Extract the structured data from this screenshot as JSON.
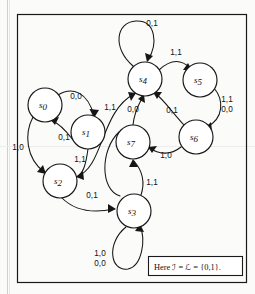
{
  "figure": {
    "type": "state-transition-diagram",
    "caption": "Here ℐ = ℒ = {0,1}.",
    "caption_parts": {
      "prefix": "Here",
      "input_alphabet_symbol": "ℐ",
      "output_alphabet_symbol": "ℒ",
      "alphabet_value": "{0,1}",
      "terminator": "."
    },
    "border_color": "#1a1a1a",
    "ink_color": "#161616",
    "background_color": "#ffffff"
  },
  "states": [
    {
      "id": "s0",
      "label": "s",
      "subscript": "0",
      "cx": 45,
      "cy": 105,
      "r": 17
    },
    {
      "id": "s1",
      "label": "s",
      "subscript": "1",
      "cx": 88,
      "cy": 132,
      "r": 17
    },
    {
      "id": "s2",
      "label": "s",
      "subscript": "2",
      "cx": 60,
      "cy": 181,
      "r": 17
    },
    {
      "id": "s3",
      "label": "s",
      "subscript": "3",
      "cx": 134,
      "cy": 211,
      "r": 17
    },
    {
      "id": "s4",
      "label": "s",
      "subscript": "4",
      "cx": 145,
      "cy": 79,
      "r": 17
    },
    {
      "id": "s5",
      "label": "s",
      "subscript": "5",
      "cx": 200,
      "cy": 80,
      "r": 17
    },
    {
      "id": "s6",
      "label": "s",
      "subscript": "6",
      "cx": 196,
      "cy": 137,
      "r": 17
    },
    {
      "id": "s7",
      "label": "s",
      "subscript": "7",
      "cx": 133,
      "cy": 142,
      "r": 17
    }
  ],
  "transitions": [
    {
      "id": "t-s0-s1",
      "from": "s0",
      "to": "s1",
      "label": "0,0",
      "label_x": 76,
      "label_y": 99
    },
    {
      "id": "t-s1-s0",
      "from": "s1",
      "to": "s0",
      "label": "0,1",
      "label_x": 64,
      "label_y": 140
    },
    {
      "id": "t-s0-s2",
      "from": "s0",
      "to": "s2",
      "label": "1,0",
      "label_x": 18,
      "label_y": 150
    },
    {
      "id": "t-s1-s2",
      "from": "s1",
      "to": "s2",
      "label": "1,1",
      "label_x": 80,
      "label_y": 162
    },
    {
      "id": "t-s2-s3",
      "from": "s2",
      "to": "s3",
      "label": "0,1",
      "label_x": 92,
      "label_y": 198
    },
    {
      "id": "t-s2-s4",
      "from": "s2",
      "to": "s4",
      "label": "1,1",
      "label_x": 110,
      "label_y": 110
    },
    {
      "id": "t-s3-s3",
      "from": "s3",
      "to": "s3",
      "label": "1,0\n0,0",
      "label_x": 100,
      "label_y": 258
    },
    {
      "id": "t-s3-s7",
      "from": "s3",
      "to": "s7",
      "label": "1,1",
      "label_x": 152,
      "label_y": 185
    },
    {
      "id": "t-s4-s4",
      "from": "s4",
      "to": "s4",
      "label": "0,1",
      "label_x": 152,
      "label_y": 26
    },
    {
      "id": "t-s4-s5",
      "from": "s4",
      "to": "s5",
      "label": "1,1",
      "label_x": 176,
      "label_y": 55
    },
    {
      "id": "t-s5-s6",
      "from": "s5",
      "to": "s6",
      "label": "1,1\n0,0",
      "label_x": 227,
      "label_y": 104
    },
    {
      "id": "t-s6-s4",
      "from": "s6",
      "to": "s4",
      "label": "0,1",
      "label_x": 172,
      "label_y": 113
    },
    {
      "id": "t-s6-s7",
      "from": "s6",
      "to": "s7",
      "label": "1,0",
      "label_x": 166,
      "label_y": 158
    },
    {
      "id": "t-s7-s4",
      "from": "s7",
      "to": "s4",
      "label": "0,0",
      "label_x": 133,
      "label_y": 112
    }
  ],
  "edge_labels": [
    {
      "id": "lbl-0-0-top",
      "text": "0,0",
      "x": 76,
      "y": 99
    },
    {
      "id": "lbl-0-1-s1s0",
      "text": "0,1",
      "x": 64,
      "y": 140
    },
    {
      "id": "lbl-1-0-left",
      "text": "1,0",
      "x": 18,
      "y": 150
    },
    {
      "id": "lbl-1-1-s1s2",
      "text": "1,1",
      "x": 80,
      "y": 162
    },
    {
      "id": "lbl-0-1-s2s3",
      "text": "0,1",
      "x": 92,
      "y": 198
    },
    {
      "id": "lbl-1-1-s2s4",
      "text": "1,1",
      "x": 110,
      "y": 110
    },
    {
      "id": "lbl-1-0-loop",
      "text": "1,0",
      "x": 100,
      "y": 256
    },
    {
      "id": "lbl-0-0-loop",
      "text": "0,0",
      "x": 100,
      "y": 266
    },
    {
      "id": "lbl-1-1-s3s7",
      "text": "1,1",
      "x": 152,
      "y": 185
    },
    {
      "id": "lbl-0-1-s4loop",
      "text": "0,1",
      "x": 152,
      "y": 26
    },
    {
      "id": "lbl-1-1-s4s5",
      "text": "1,1",
      "x": 176,
      "y": 55
    },
    {
      "id": "lbl-1-1-s5s6",
      "text": "1,1",
      "x": 227,
      "y": 102
    },
    {
      "id": "lbl-0-0-s5s6",
      "text": "0,0",
      "x": 227,
      "y": 112
    },
    {
      "id": "lbl-0-1-s6s4",
      "text": "0,1",
      "x": 172,
      "y": 113
    },
    {
      "id": "lbl-1-0-s6s7",
      "text": "1,0",
      "x": 166,
      "y": 158
    },
    {
      "id": "lbl-0-0-s7s4",
      "text": "0,0",
      "x": 133,
      "y": 112
    }
  ]
}
